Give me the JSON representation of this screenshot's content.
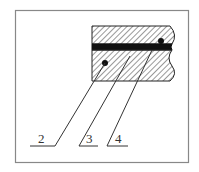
{
  "figure": {
    "type": "cross-section",
    "frame_color": "#888888",
    "line_color": "#222222",
    "fill_band_color": "#111111",
    "callouts": [
      {
        "label": "2"
      },
      {
        "label": "3"
      },
      {
        "label": "4"
      }
    ]
  }
}
